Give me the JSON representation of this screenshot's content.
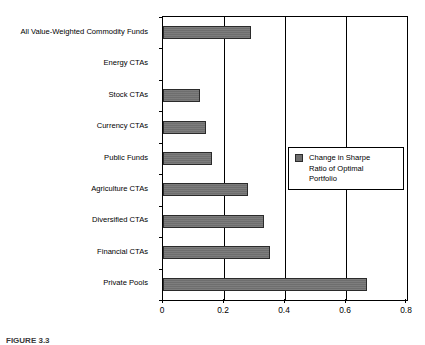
{
  "figure": {
    "caption": "FIGURE 3.3"
  },
  "legend": {
    "position": "inside-right-middle",
    "swatch_name": "series-swatch",
    "label": "Change in Sharpe\nRatio of Optimal\nPortfolio"
  },
  "chart_data": {
    "type": "bar",
    "orientation": "horizontal",
    "title": "",
    "xlabel": "",
    "ylabel": "",
    "xlim": [
      0,
      0.8
    ],
    "xticks": [
      0,
      0.2,
      0.4,
      0.6,
      0.8
    ],
    "xticklabels": [
      "0",
      "0.2",
      "0.4",
      "0.6",
      "0.8"
    ],
    "grid": true,
    "grid_axis": "x",
    "legend_position": "inside-right-middle",
    "series_name": "Change in Sharpe Ratio of Optimal Portfolio",
    "bar_color": "#6E6E6E",
    "bar_edge_color": "#2B2B2B",
    "categories": [
      "All Value-Weighted Commodity Funds",
      "Energy CTAs",
      "Stock CTAs",
      "Currency CTAs",
      "Public Funds",
      "Agriculture CTAs",
      "Diversified CTAs",
      "Financial CTAs",
      "Private Pools"
    ],
    "values": [
      0.29,
      0.0,
      0.12,
      0.14,
      0.16,
      0.28,
      0.33,
      0.35,
      0.67
    ]
  }
}
